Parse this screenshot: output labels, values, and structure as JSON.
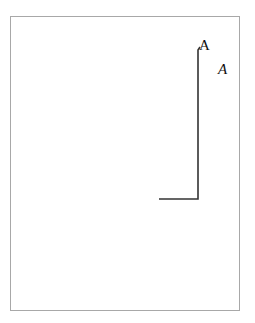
{
  "diagram": {
    "labels": [
      {
        "id": "label-upright",
        "text": "A",
        "style": "upright"
      },
      {
        "id": "label-italic",
        "text": "A",
        "style": "italic"
      }
    ],
    "colors": {
      "frame": "#a8a8a8",
      "line": "#333333",
      "text": "#111111"
    }
  }
}
